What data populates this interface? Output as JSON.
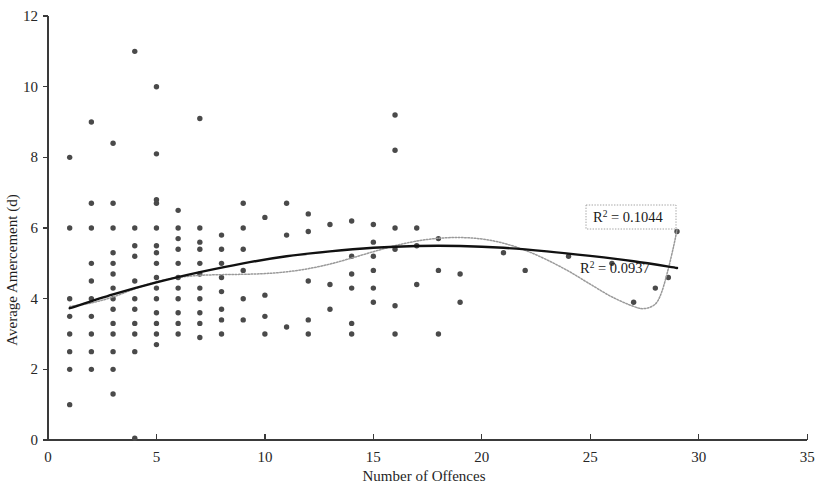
{
  "chart_data": {
    "type": "scatter",
    "title": "",
    "xlabel": "Number of Offences",
    "ylabel": "Average Amercement (d)",
    "xlim": [
      0,
      35
    ],
    "ylim": [
      0,
      12
    ],
    "xticks": [
      0,
      5,
      10,
      15,
      20,
      25,
      30,
      35
    ],
    "yticks": [
      0,
      2,
      4,
      6,
      8,
      10,
      12
    ],
    "xtick_labels": [
      "0",
      "5",
      "10",
      "15",
      "20",
      "25",
      "30",
      "35"
    ],
    "ytick_labels": [
      "0",
      "2",
      "4",
      "6",
      "8",
      "10",
      "12"
    ],
    "grid": false,
    "legend": false,
    "point_color": "#4a4a4a",
    "points": [
      [
        1,
        1.0
      ],
      [
        1,
        2.0
      ],
      [
        1,
        3.0
      ],
      [
        1,
        4.0
      ],
      [
        1,
        6.0
      ],
      [
        1,
        8.0
      ],
      [
        1,
        3.5
      ],
      [
        1,
        2.5
      ],
      [
        2,
        2.5
      ],
      [
        2,
        3.0
      ],
      [
        2,
        3.5
      ],
      [
        2,
        4.0
      ],
      [
        2,
        4.5
      ],
      [
        2,
        5.0
      ],
      [
        2,
        6.0
      ],
      [
        2,
        9.0
      ],
      [
        2,
        2.0
      ],
      [
        2,
        6.7
      ],
      [
        3,
        1.3
      ],
      [
        3,
        2.0
      ],
      [
        3,
        2.5
      ],
      [
        3,
        3.0
      ],
      [
        3,
        3.3
      ],
      [
        3,
        3.7
      ],
      [
        3,
        4.0
      ],
      [
        3,
        4.3
      ],
      [
        3,
        4.7
      ],
      [
        3,
        5.0
      ],
      [
        3,
        5.3
      ],
      [
        3,
        6.0
      ],
      [
        3,
        6.7
      ],
      [
        3,
        8.4
      ],
      [
        4,
        2.5
      ],
      [
        4,
        3.0
      ],
      [
        4,
        3.3
      ],
      [
        4,
        3.7
      ],
      [
        4,
        4.0
      ],
      [
        4,
        4.5
      ],
      [
        4,
        5.2
      ],
      [
        4,
        5.5
      ],
      [
        4,
        6.0
      ],
      [
        4,
        11.0
      ],
      [
        4,
        0.05
      ],
      [
        5,
        2.7
      ],
      [
        5,
        3.0
      ],
      [
        5,
        3.3
      ],
      [
        5,
        3.6
      ],
      [
        5,
        4.0
      ],
      [
        5,
        4.3
      ],
      [
        5,
        4.6
      ],
      [
        5,
        5.0
      ],
      [
        5,
        5.3
      ],
      [
        5,
        5.5
      ],
      [
        5,
        6.0
      ],
      [
        5,
        6.7
      ],
      [
        5,
        8.1
      ],
      [
        5,
        10.0
      ],
      [
        5,
        6.8
      ],
      [
        6,
        3.0
      ],
      [
        6,
        3.3
      ],
      [
        6,
        3.6
      ],
      [
        6,
        4.0
      ],
      [
        6,
        4.3
      ],
      [
        6,
        4.6
      ],
      [
        6,
        5.0
      ],
      [
        6,
        5.4
      ],
      [
        6,
        5.7
      ],
      [
        6,
        6.0
      ],
      [
        6,
        6.5
      ],
      [
        7,
        2.9
      ],
      [
        7,
        3.3
      ],
      [
        7,
        3.6
      ],
      [
        7,
        4.0
      ],
      [
        7,
        4.3
      ],
      [
        7,
        4.7
      ],
      [
        7,
        5.0
      ],
      [
        7,
        5.4
      ],
      [
        7,
        5.6
      ],
      [
        7,
        6.0
      ],
      [
        7,
        9.1
      ],
      [
        8,
        3.0
      ],
      [
        8,
        3.4
      ],
      [
        8,
        3.7
      ],
      [
        8,
        4.2
      ],
      [
        8,
        4.6
      ],
      [
        8,
        5.0
      ],
      [
        8,
        5.4
      ],
      [
        8,
        5.8
      ],
      [
        9,
        3.4
      ],
      [
        9,
        4.0
      ],
      [
        9,
        4.8
      ],
      [
        9,
        5.4
      ],
      [
        9,
        6.0
      ],
      [
        9,
        6.7
      ],
      [
        10,
        3.0
      ],
      [
        10,
        3.5
      ],
      [
        10,
        4.1
      ],
      [
        10,
        6.3
      ],
      [
        11,
        3.2
      ],
      [
        11,
        5.8
      ],
      [
        11,
        6.7
      ],
      [
        12,
        3.0
      ],
      [
        12,
        3.4
      ],
      [
        12,
        4.5
      ],
      [
        12,
        5.9
      ],
      [
        12,
        6.4
      ],
      [
        13,
        3.7
      ],
      [
        13,
        4.4
      ],
      [
        13,
        6.1
      ],
      [
        14,
        3.0
      ],
      [
        14,
        3.3
      ],
      [
        14,
        4.3
      ],
      [
        14,
        4.7
      ],
      [
        14,
        5.2
      ],
      [
        14,
        6.2
      ],
      [
        15,
        3.9
      ],
      [
        15,
        4.3
      ],
      [
        15,
        4.8
      ],
      [
        15,
        5.2
      ],
      [
        15,
        5.6
      ],
      [
        15,
        6.1
      ],
      [
        16,
        3.0
      ],
      [
        16,
        3.8
      ],
      [
        16,
        5.4
      ],
      [
        16,
        6.0
      ],
      [
        16,
        8.2
      ],
      [
        16,
        9.2
      ],
      [
        17,
        4.4
      ],
      [
        17,
        5.5
      ],
      [
        17,
        6.0
      ],
      [
        18,
        3.0
      ],
      [
        18,
        4.8
      ],
      [
        18,
        5.7
      ],
      [
        19,
        3.9
      ],
      [
        19,
        4.7
      ],
      [
        21,
        5.3
      ],
      [
        22,
        4.8
      ],
      [
        24,
        5.2
      ],
      [
        26,
        5.0
      ],
      [
        28,
        4.3
      ],
      [
        27,
        3.9
      ],
      [
        28.6,
        4.6
      ],
      [
        29,
        5.9
      ]
    ],
    "trendlines": [
      {
        "name": "linear",
        "style": "solid-black",
        "r2_label": "R² = 0.0937",
        "r2_value": 0.0937,
        "path_points": [
          [
            1,
            3.73
          ],
          [
            3,
            4.12
          ],
          [
            5,
            4.46
          ],
          [
            7,
            4.75
          ],
          [
            9,
            5.0
          ],
          [
            11,
            5.2
          ],
          [
            13,
            5.34
          ],
          [
            15,
            5.44
          ],
          [
            17,
            5.49
          ],
          [
            19,
            5.49
          ],
          [
            21,
            5.44
          ],
          [
            23,
            5.34
          ],
          [
            25,
            5.21
          ],
          [
            27,
            5.06
          ],
          [
            29,
            4.87
          ]
        ]
      },
      {
        "name": "polynomial",
        "style": "dotted-gray",
        "r2_label": "R² = 0.1044",
        "r2_value": 0.1044,
        "path_points": [
          [
            1,
            3.78
          ],
          [
            2,
            3.88
          ],
          [
            3,
            4.05
          ],
          [
            4,
            4.28
          ],
          [
            5,
            4.48
          ],
          [
            6,
            4.6
          ],
          [
            7,
            4.66
          ],
          [
            8,
            4.68
          ],
          [
            9,
            4.69
          ],
          [
            10,
            4.71
          ],
          [
            11,
            4.76
          ],
          [
            12,
            4.85
          ],
          [
            13,
            4.98
          ],
          [
            14,
            5.15
          ],
          [
            15,
            5.33
          ],
          [
            16,
            5.5
          ],
          [
            17,
            5.63
          ],
          [
            18,
            5.71
          ],
          [
            19,
            5.73
          ],
          [
            20,
            5.69
          ],
          [
            21,
            5.57
          ],
          [
            22,
            5.37
          ],
          [
            23,
            5.1
          ],
          [
            24,
            4.78
          ],
          [
            25,
            4.41
          ],
          [
            26,
            4.05
          ],
          [
            27,
            3.78
          ],
          [
            27.5,
            3.72
          ],
          [
            28,
            3.85
          ],
          [
            28.3,
            4.2
          ],
          [
            28.6,
            4.85
          ],
          [
            28.85,
            5.5
          ],
          [
            29,
            5.95
          ]
        ]
      }
    ],
    "annotations": [
      {
        "id": "r2-upper",
        "text_prefix": "R",
        "text_sup": "2",
        "text_suffix": " = 0.1044",
        "full_text": "R² = 0.1044",
        "boxed": true,
        "x_px": 586,
        "y_px": 205,
        "w_px": 90,
        "h_px": 24
      },
      {
        "id": "r2-lower",
        "text_prefix": "R",
        "text_sup": "2",
        "text_suffix": " = 0.0937",
        "full_text": "R² = 0.0937",
        "boxed": false,
        "x_px": 580,
        "y_px": 258,
        "w_px": 90,
        "h_px": 22
      }
    ]
  },
  "axes": {
    "x_axis_name": "x-axis",
    "y_axis_name": "y-axis",
    "origin_px": [
      48,
      440
    ],
    "x_px_per_unit": 21.69,
    "y_px_per_unit": 35.33
  }
}
